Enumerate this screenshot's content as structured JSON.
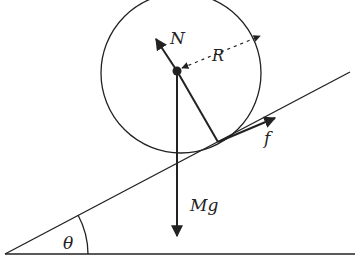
{
  "diagram": {
    "labels": {
      "normal_force": "N",
      "radius": "R",
      "friction": "f",
      "weight": "Mg",
      "angle": "θ"
    },
    "colors": {
      "stroke": "#222222",
      "background": "#ffffff"
    }
  }
}
